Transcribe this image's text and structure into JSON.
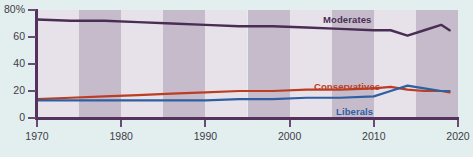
{
  "chart_data": {
    "type": "line",
    "title": "",
    "xlabel": "",
    "ylabel": "",
    "xlim": [
      1970,
      2020
    ],
    "ylim": [
      0,
      80
    ],
    "grid": false,
    "legend_position": "inline-annotations",
    "y_ticks": [
      "80%",
      "60",
      "40",
      "20",
      "0"
    ],
    "y_tick_values": [
      80,
      60,
      40,
      20,
      0
    ],
    "x_ticks": [
      "1970",
      "1980",
      "1990",
      "2000",
      "2010",
      "2020"
    ],
    "x_tick_values": [
      1970,
      1980,
      1990,
      2000,
      2010,
      2020
    ],
    "background_bands": "alternating 5-year vertical shading",
    "series": [
      {
        "name": "Moderates",
        "color": "#4a2d54",
        "label_x": 1970,
        "x": [
          1970,
          1974,
          1978,
          1982,
          1986,
          1990,
          1994,
          1998,
          2002,
          2006,
          2010,
          2012,
          2014,
          2016,
          2018,
          2019
        ],
        "values": [
          73,
          72,
          72,
          71,
          70,
          69,
          68,
          68,
          67,
          66,
          65,
          65,
          61,
          65,
          69,
          65
        ]
      },
      {
        "name": "Conservatives",
        "color": "#bb3e22",
        "x": [
          1970,
          1974,
          1978,
          1982,
          1986,
          1990,
          1994,
          1998,
          2002,
          2006,
          2010,
          2012,
          2014,
          2016,
          2018,
          2019
        ],
        "values": [
          14,
          15,
          16,
          17,
          18,
          19,
          20,
          20,
          21,
          21,
          22,
          23,
          21,
          20,
          20,
          19
        ]
      },
      {
        "name": "Liberals",
        "color": "#2e5fa3",
        "x": [
          1970,
          1974,
          1978,
          1982,
          1986,
          1990,
          1994,
          1998,
          2002,
          2006,
          2010,
          2012,
          2014,
          2016,
          2018,
          2019
        ],
        "values": [
          13,
          13,
          13,
          13,
          13,
          13,
          14,
          14,
          15,
          15,
          16,
          20,
          24,
          22,
          20,
          20
        ]
      }
    ]
  },
  "annotations": {
    "moderates": {
      "label": "Moderates",
      "color": "#4a2d54"
    },
    "conservatives": {
      "label": "Conservatives",
      "color": "#bb3e22"
    },
    "liberals": {
      "label": "Liberals",
      "color": "#2e5fa3"
    }
  },
  "colors": {
    "page_background": "#e3eeee",
    "band_light": "#e7e2ea",
    "band_dark": "#c6bbcb",
    "axis": "#55325e",
    "tick_text": "#3d3d48"
  }
}
